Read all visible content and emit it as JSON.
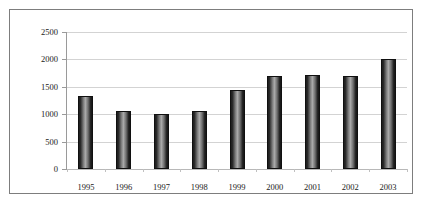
{
  "chart_data": {
    "type": "bar",
    "title": "",
    "subtitle": "",
    "xlabel": "",
    "ylabel": "",
    "categories": [
      "1995",
      "1996",
      "1997",
      "1998",
      "1999",
      "2000",
      "2001",
      "2002",
      "2003"
    ],
    "values": [
      1330,
      1050,
      1000,
      1060,
      1450,
      1700,
      1720,
      1700,
      2010
    ],
    "series": [
      {
        "name": "",
        "values": [
          1330,
          1050,
          1000,
          1060,
          1450,
          1700,
          1720,
          1700,
          2010
        ]
      }
    ],
    "ylim": [
      0,
      2500
    ],
    "yticks": [
      0,
      500,
      1000,
      1500,
      2000,
      2500
    ],
    "ytick_labels": [
      "0",
      "500",
      "1000",
      "1500",
      "2000",
      "2500"
    ],
    "grid": true,
    "legend": false,
    "legend_position": "none",
    "bar_color": "#3b3b3b",
    "bar_border_color": "#101010",
    "gridline_color": "#d3d3d3",
    "axis_color": "#9a9a9a",
    "frame_color": "#7d7d7d",
    "background": "#ffffff",
    "annotations": []
  },
  "caption": {
    "text": ""
  }
}
